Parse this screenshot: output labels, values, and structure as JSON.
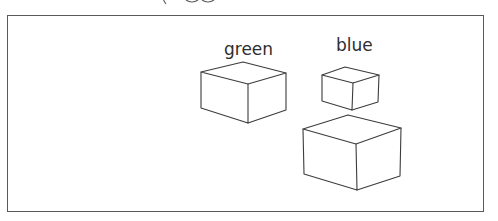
{
  "caption": {
    "text_visible": false,
    "note": "clipped at top edge; only descenders of glyphs visible"
  },
  "diagram": {
    "frame": {
      "stroke": "#5a5a5a"
    },
    "labels": [
      {
        "id": "green",
        "text": "green"
      },
      {
        "id": "blue",
        "text": "blue"
      }
    ],
    "boxes": [
      {
        "id": "box-green",
        "label": "green",
        "size": "medium"
      },
      {
        "id": "box-blue",
        "label": "blue",
        "size": "small"
      },
      {
        "id": "box-unlabeled",
        "label": "",
        "size": "large"
      }
    ],
    "line_color": "#3c3c3c",
    "text_color": "#2e2e2e"
  }
}
